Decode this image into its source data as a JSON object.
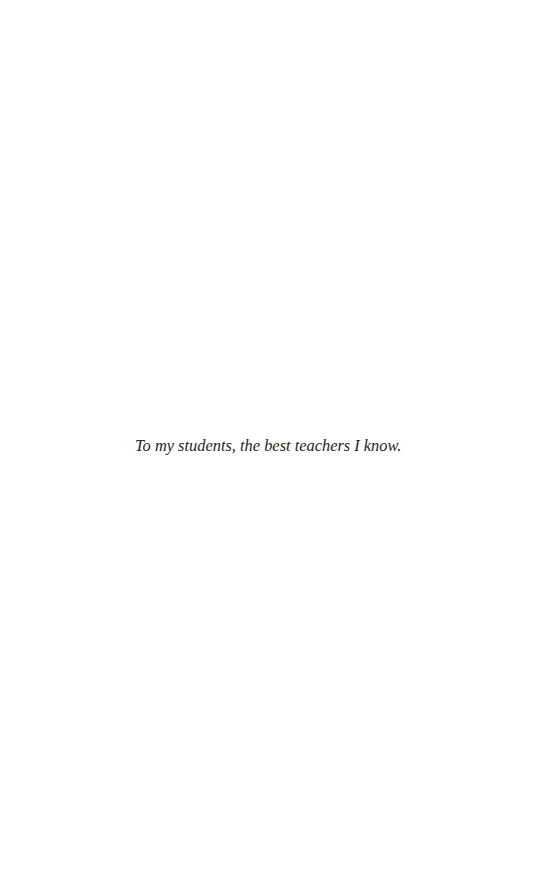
{
  "page": {
    "dedication": "To my students, the best teachers I know."
  }
}
